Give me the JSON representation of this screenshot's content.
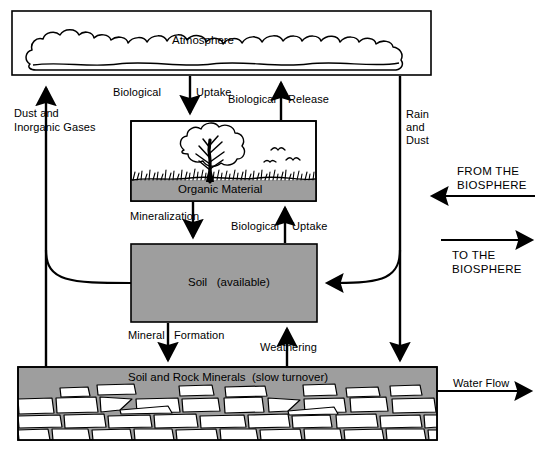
{
  "diagram": {
    "type": "biogeochemical-cycle-flow-diagram",
    "colors": {
      "background": "#ffffff",
      "stroke": "#000000",
      "compartment_fill": "#9e9e9e",
      "rock_fill": "#ffffff"
    },
    "compartments": [
      {
        "id": "atmosphere",
        "label": "Atmosphere",
        "fill": "#ffffff",
        "motif": "cloud"
      },
      {
        "id": "organic_material",
        "label": "Organic Material",
        "fill": "#9e9e9e",
        "motif": "tree-grass-birds"
      },
      {
        "id": "soil_available",
        "label": "Soil   (available)",
        "fill": "#9e9e9e",
        "motif": "solid"
      },
      {
        "id": "soil_rock_minerals",
        "label": "Soil and Rock Minerals  (slow turnover)",
        "fill": "#9e9e9e",
        "motif": "stone-masonry"
      }
    ],
    "flows": [
      {
        "id": "biological_uptake_atmosphere",
        "label": "Biological  Uptake",
        "label_left": "Biological",
        "label_right": "Uptake",
        "from": "atmosphere",
        "to": "organic_material",
        "direction": "down"
      },
      {
        "id": "biological_release",
        "label": "Biological  Release",
        "label_left": "Biological",
        "label_right": "Release",
        "from": "organic_material",
        "to": "atmosphere",
        "direction": "up"
      },
      {
        "id": "mineralization",
        "label": "Mineralization",
        "from": "organic_material",
        "to": "soil_available",
        "direction": "down"
      },
      {
        "id": "biological_uptake_soil",
        "label": "Biological  Uptake",
        "label_left": "Biological",
        "label_right": "Uptake",
        "from": "soil_available",
        "to": "organic_material",
        "direction": "up"
      },
      {
        "id": "mineral_formation",
        "label": "Mineral  Formation",
        "label_left": "Mineral",
        "label_right": "Formation",
        "from": "soil_available",
        "to": "soil_rock_minerals",
        "direction": "down"
      },
      {
        "id": "weathering",
        "label": "Weathering",
        "from": "soil_rock_minerals",
        "to": "soil_available",
        "direction": "up"
      },
      {
        "id": "dust_and_inorganic_gases",
        "label_line1": "Dust and",
        "label_line2": "Inorganic Gases",
        "from": "soil_rock_minerals",
        "to": "atmosphere",
        "direction": "up"
      },
      {
        "id": "rain_and_dust",
        "label_line1": "Rain",
        "label_line2": "and",
        "label_line3": "Dust",
        "from": "atmosphere",
        "to": "soil_rock_minerals",
        "direction": "down"
      },
      {
        "id": "from_the_biosphere",
        "label_line1": "FROM THE",
        "label_line2": "BIOSPHERE",
        "direction": "left"
      },
      {
        "id": "to_the_biosphere",
        "label_line1": "TO THE",
        "label_line2": "BIOSPHERE",
        "direction": "right"
      },
      {
        "id": "water_flow",
        "label": "Water Flow",
        "from": "soil_rock_minerals",
        "direction": "right"
      }
    ]
  }
}
